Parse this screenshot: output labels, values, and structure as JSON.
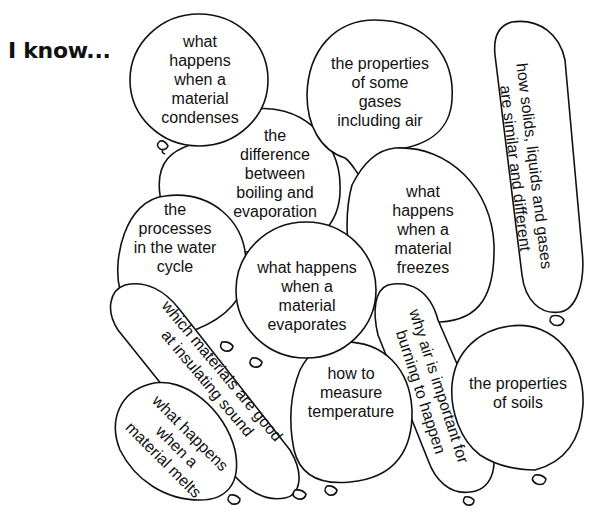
{
  "title": "I know...",
  "balloons": [
    {
      "id": "condenses",
      "text": "what\nhappens\nwhen a\nmaterial\ncondenses"
    },
    {
      "id": "boiling-evaporation",
      "text": "the\ndifference\nbetween\nboiling and\nevaporation"
    },
    {
      "id": "water-cycle",
      "text": "the\nprocesses\nin the water\ncycle"
    },
    {
      "id": "evaporates",
      "text": "what happens\nwhen a\nmaterial\nevaporates"
    },
    {
      "id": "gases-air",
      "text": "the properties\nof some\ngases\nincluding air"
    },
    {
      "id": "freezes",
      "text": "what\nhappens\nwhen a\nmaterial\nfreezes"
    },
    {
      "id": "solids-liquids-gases",
      "text": "how solids, liquids and gases\nare similar and different"
    },
    {
      "id": "insulating-sound",
      "text": "which materials are good\nat insulating sound"
    },
    {
      "id": "melts",
      "text": "what happens\nwhen a\nmaterial melts"
    },
    {
      "id": "measure-temperature",
      "text": "how to\nmeasure\ntemperature"
    },
    {
      "id": "air-burning",
      "text": "why air is important for\nburning to happen"
    },
    {
      "id": "soils",
      "text": "the properties\nof soils"
    }
  ]
}
